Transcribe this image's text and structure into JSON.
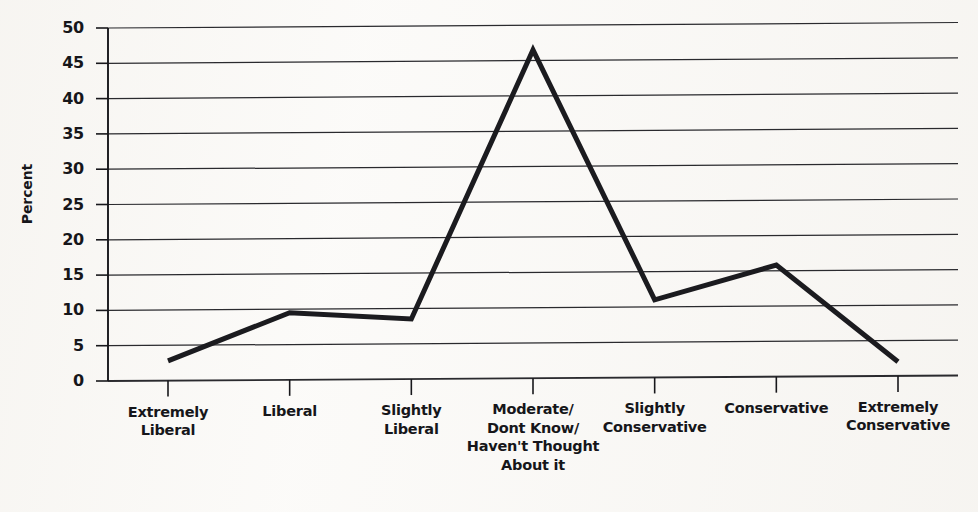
{
  "chart_data": {
    "type": "line",
    "title": "",
    "xlabel": "",
    "ylabel": "Percent",
    "ylim": [
      0,
      50
    ],
    "ytick_step": 5,
    "grid": true,
    "legend": null,
    "categories": [
      "Extremely\nLiberal",
      "Liberal",
      "Slightly\nLiberal",
      "Moderate/\nDont Know/\nHaven't Thought\nAbout it",
      "Slightly\nConservative",
      "Conservative",
      "Extremely\nConservative"
    ],
    "values": [
      2.8,
      9.5,
      8.5,
      46.5,
      11.0,
      15.8,
      2.0
    ],
    "ytick_labels": [
      "0",
      "5",
      "10",
      "15",
      "20",
      "25",
      "30",
      "35",
      "40",
      "45",
      "50"
    ],
    "series": [
      {
        "name": "Percent",
        "values": [
          2.8,
          9.5,
          8.5,
          46.5,
          11.0,
          15.8,
          2.0
        ]
      }
    ],
    "colors": {
      "line": "#1b1b1f",
      "grid": "#2a2a2e",
      "axis": "#17171b",
      "background": "#fbfaf8",
      "text": "#16161a"
    }
  }
}
